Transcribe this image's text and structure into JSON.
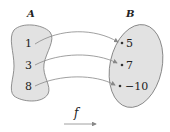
{
  "diagram": {
    "type": "function-mapping",
    "sets": {
      "A": {
        "label": "A",
        "elements": [
          "1",
          "3",
          "8"
        ]
      },
      "B": {
        "label": "B",
        "elements": [
          "5",
          "7",
          "−10"
        ]
      }
    },
    "mappings": [
      {
        "from": "1",
        "to": "5"
      },
      {
        "from": "3",
        "to": "7"
      },
      {
        "from": "8",
        "to": "−10"
      }
    ],
    "function_label": "f",
    "colors": {
      "set_fill": "#e2e2e2",
      "set_stroke": "#777777",
      "arrow": "#888888",
      "text": "#222222"
    }
  }
}
